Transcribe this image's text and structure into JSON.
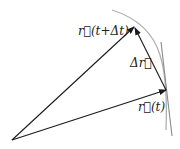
{
  "diagram": {
    "title": "",
    "colors": {
      "vector": "#1a1a1a",
      "curve": "#b0b0b0",
      "tangent": "#8a8a8a",
      "text": "#222222"
    },
    "points": {
      "origin": {
        "x": 12,
        "y": 140
      },
      "r_t_tip": {
        "x": 166,
        "y": 90
      },
      "r_t_dt_tip": {
        "x": 134,
        "y": 27
      }
    },
    "labels": {
      "r_t_dt": "r⃗(t+Δt)",
      "r_t": "r⃗(t)",
      "delta_r": "Δr⃗"
    },
    "vectors": [
      {
        "name": "r(t)",
        "from": "origin",
        "to": "r_t_tip"
      },
      {
        "name": "r(t+Δt)",
        "from": "origin",
        "to": "r_t_dt_tip"
      },
      {
        "name": "Δr",
        "from": "r_t_tip",
        "to": "r_t_dt_tip"
      }
    ],
    "curves": [
      {
        "name": "trajectory-arc",
        "type": "arc"
      },
      {
        "name": "tangent-line",
        "type": "line"
      }
    ]
  }
}
